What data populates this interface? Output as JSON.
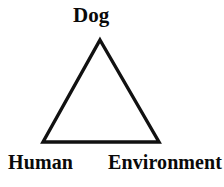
{
  "figure": {
    "type": "triangle-diagram",
    "background_color": "#ffffff",
    "stroke_color": "#111111",
    "text_color": "#0a0a0a",
    "width": 224,
    "height": 187,
    "shape": {
      "name": "triangle",
      "filled": false,
      "stroke_width": 3,
      "vertices": [
        {
          "id": "apex",
          "x": 100,
          "y": 40
        },
        {
          "id": "bottom-left",
          "x": 43,
          "y": 142
        },
        {
          "id": "bottom-right",
          "x": 159,
          "y": 142
        }
      ]
    },
    "labels": {
      "top": "Dog",
      "bottom_left": "Human",
      "bottom_right": "Environment"
    }
  }
}
